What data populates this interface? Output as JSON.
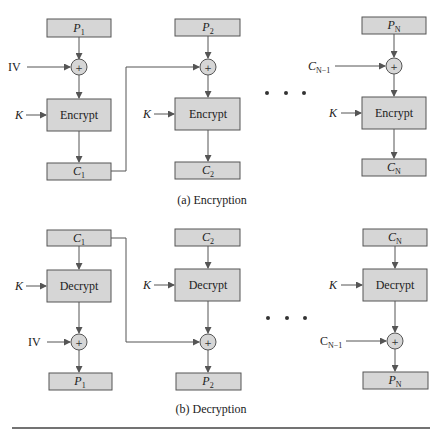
{
  "diagram": {
    "encryption": {
      "caption": "(a) Encryption",
      "columns": [
        {
          "input": {
            "base": "P",
            "sub": "1"
          },
          "xor_input": "IV",
          "key": "K",
          "op": "Encrypt",
          "output": {
            "base": "C",
            "sub": "1"
          }
        },
        {
          "input": {
            "base": "P",
            "sub": "2"
          },
          "xor_input": "",
          "key": "K",
          "op": "Encrypt",
          "output": {
            "base": "C",
            "sub": "2"
          }
        },
        {
          "input": {
            "base": "P",
            "sub": "N"
          },
          "xor_input": {
            "base": "C",
            "sub": "N−1"
          },
          "key": "K",
          "op": "Encrypt",
          "output": {
            "base": "C",
            "sub": "N"
          }
        }
      ],
      "ellipsis": "• • •"
    },
    "decryption": {
      "caption": "(b) Decryption",
      "columns": [
        {
          "input": {
            "base": "C",
            "sub": "1"
          },
          "key": "K",
          "op": "Decrypt",
          "xor_input": "IV",
          "output": {
            "base": "P",
            "sub": "1"
          }
        },
        {
          "input": {
            "base": "C",
            "sub": "2"
          },
          "key": "K",
          "op": "Decrypt",
          "xor_input": "",
          "output": {
            "base": "P",
            "sub": "2"
          }
        },
        {
          "input": {
            "base": "C",
            "sub": "N"
          },
          "key": "K",
          "op": "Decrypt",
          "xor_input": {
            "base": "C",
            "sub": "N−1"
          },
          "output": {
            "base": "P",
            "sub": "N"
          }
        }
      ],
      "ellipsis": "• • •"
    },
    "xor_symbol": "+",
    "colors": {
      "box_fill": "#d6d6d6",
      "stroke": "#555555",
      "text": "#222222"
    }
  }
}
